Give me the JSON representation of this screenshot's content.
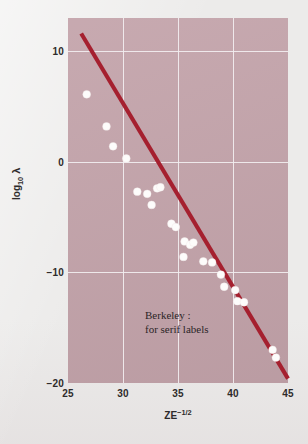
{
  "figure": {
    "width": 308,
    "height": 444,
    "page_background": "#ecebea",
    "plot_background": "#c3a3aa",
    "gridline_color": "#f2eef0",
    "line_color": "#a5202f",
    "point_color": "#fdfcfb",
    "text_color": "#2e2b2b"
  },
  "chart_data": {
    "type": "scatter",
    "title": "",
    "xlabel": "ZE−1/2",
    "ylabel": "log10 λ",
    "xlim": [
      25,
      45
    ],
    "ylim": [
      -20,
      13
    ],
    "grid": true,
    "legend": null,
    "xticks": [
      25,
      30,
      35,
      40,
      45
    ],
    "xtick_labels": [
      "25",
      "30",
      "35",
      "40",
      "45"
    ],
    "yticks": [
      10,
      0,
      -10,
      -20
    ],
    "ytick_labels": [
      "10",
      "0",
      "−10",
      "−20"
    ],
    "gridlines_x": [
      30,
      35,
      40
    ],
    "gridlines_y": [
      10,
      0,
      -10
    ],
    "annotations": [
      {
        "text_line1": "Berkeley :",
        "text_line2": "for serif labels",
        "x": 32.0,
        "y": -13.2
      }
    ],
    "series": [
      {
        "name": "measurements",
        "type": "scatter",
        "marker": "circle",
        "color": "#fdfcfb",
        "points": [
          {
            "x": 26.7,
            "y": 6.1
          },
          {
            "x": 28.5,
            "y": 3.2
          },
          {
            "x": 29.1,
            "y": 1.4
          },
          {
            "x": 30.3,
            "y": 0.3
          },
          {
            "x": 31.3,
            "y": -2.7
          },
          {
            "x": 32.2,
            "y": -2.9
          },
          {
            "x": 33.1,
            "y": -2.4
          },
          {
            "x": 33.4,
            "y": -2.3
          },
          {
            "x": 32.6,
            "y": -3.9
          },
          {
            "x": 34.4,
            "y": -5.6
          },
          {
            "x": 34.8,
            "y": -5.9
          },
          {
            "x": 35.6,
            "y": -7.2
          },
          {
            "x": 36.1,
            "y": -7.5
          },
          {
            "x": 36.4,
            "y": -7.3
          },
          {
            "x": 35.5,
            "y": -8.6
          },
          {
            "x": 37.3,
            "y": -9.0
          },
          {
            "x": 38.1,
            "y": -9.1
          },
          {
            "x": 38.9,
            "y": -10.2
          },
          {
            "x": 39.2,
            "y": -11.3
          },
          {
            "x": 40.2,
            "y": -11.6
          },
          {
            "x": 40.4,
            "y": -12.6
          },
          {
            "x": 41.0,
            "y": -12.7
          },
          {
            "x": 43.6,
            "y": -17.0
          },
          {
            "x": 43.9,
            "y": -17.7
          }
        ]
      },
      {
        "name": "fit-line",
        "type": "line",
        "color": "#a5202f",
        "points": [
          {
            "x": 26.2,
            "y": 11.6
          },
          {
            "x": 45.0,
            "y": -19.6
          }
        ]
      }
    ]
  }
}
